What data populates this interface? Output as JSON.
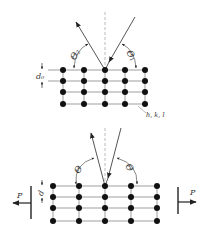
{
  "figure": {
    "colors": {
      "ink": "#222222",
      "line": "#555555",
      "dashed": "#aaaaaa",
      "background": "#ffffff"
    },
    "upper": {
      "lattice": {
        "columns": [
          63,
          84,
          105,
          125,
          145
        ],
        "rows": [
          70,
          81,
          92,
          104
        ]
      },
      "normal_line": {
        "x": 105,
        "y1": 12,
        "y2": 70
      },
      "angle_left_label": "Θ₂",
      "angle_right_label": "Θ₁",
      "spacing_label": "d₀",
      "plane_label": "h, k, l"
    },
    "lower": {
      "lattice": {
        "columns": [
          53,
          79,
          105,
          131,
          157
        ],
        "rows": [
          186,
          197,
          208,
          221
        ]
      },
      "normal_line": {
        "x": 105,
        "y1": 128,
        "y2": 186
      },
      "angle_left_label": "Θ",
      "angle_right_label": "Θ",
      "spacing_label": "d",
      "force_left_label": "P",
      "force_right_label": "P"
    }
  }
}
